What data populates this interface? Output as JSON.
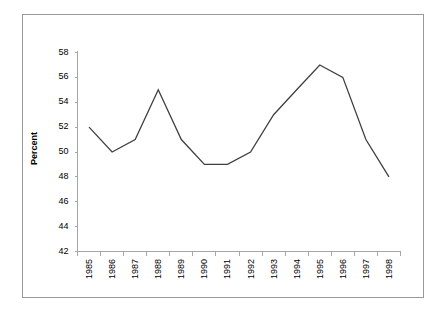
{
  "chart_data": {
    "type": "line",
    "title": "",
    "subtitle": "",
    "xlabel": "",
    "ylabel": "Percent",
    "categories": [
      "1985",
      "1986",
      "1987",
      "1988",
      "1989",
      "1990",
      "1991",
      "1992",
      "1993",
      "1994",
      "1995",
      "1996",
      "1997",
      "1998"
    ],
    "values": [
      52,
      50,
      51,
      55,
      51,
      49,
      49,
      50,
      53,
      55,
      57,
      56,
      51,
      48
    ],
    "series": [
      {
        "name": "Percent",
        "values": [
          52,
          50,
          51,
          55,
          51,
          49,
          49,
          50,
          53,
          55,
          57,
          56,
          51,
          48
        ]
      }
    ],
    "ylim": [
      42,
      58
    ],
    "ytick_labels": [
      "58",
      "56",
      "54",
      "52",
      "50",
      "48",
      "46",
      "44",
      "42"
    ],
    "ytick_values": [
      58,
      56,
      54,
      52,
      50,
      48,
      46,
      44,
      42
    ],
    "xtick_labels": [
      "1985",
      "1986",
      "1987",
      "1988",
      "1989",
      "1990",
      "1991",
      "1992",
      "1993",
      "1994",
      "1995",
      "1996",
      "1997",
      "1998"
    ],
    "grid": false,
    "legend": false,
    "legend_position": "none",
    "annotations": [],
    "line_color": "#404040",
    "axis_color": "#a6a6a6",
    "frame_color": "#9a9a9a",
    "background_color": "#ffffff",
    "markers": false
  }
}
